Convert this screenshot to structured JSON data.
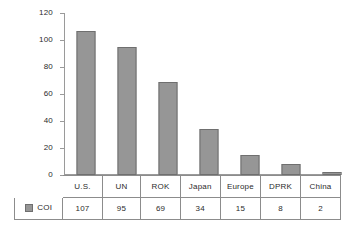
{
  "chart_data": {
    "type": "bar",
    "title": "",
    "subtitle": "",
    "xlabel": "",
    "ylabel": "",
    "categories": [
      "U.S.",
      "UN",
      "ROK",
      "Japan",
      "Europe",
      "DPRK",
      "China"
    ],
    "values": [
      107,
      95,
      69,
      34,
      15,
      8,
      2
    ],
    "series": [
      {
        "name": "COI",
        "values": [
          107,
          95,
          69,
          34,
          15,
          8,
          2
        ]
      }
    ],
    "ylim": [
      0,
      120
    ],
    "ytick_labels": [
      "0",
      "20",
      "40",
      "60",
      "80",
      "100",
      "120"
    ],
    "ytick_values": [
      0,
      20,
      40,
      60,
      80,
      100,
      120
    ],
    "grid": false,
    "legend_position": "data-table-row-header",
    "bar_color": "#969696",
    "bar_border_color": "#6f6f6f",
    "axis_color": "#9a9a9a"
  },
  "table": {
    "row_header_label": "COI",
    "legend_swatch_name": "legend-color-swatch",
    "category_headers": [
      "U.S.",
      "UN",
      "ROK",
      "Japan",
      "Europe",
      "DPRK",
      "China"
    ],
    "value_cells": [
      "107",
      "95",
      "69",
      "34",
      "15",
      "8",
      "2"
    ]
  }
}
